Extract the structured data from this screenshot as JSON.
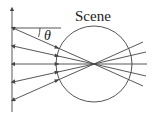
{
  "diagram": {
    "scene_label": "Scene",
    "angle_label": "θ",
    "ray_count": 5,
    "rays_meet_at": "scene center",
    "axis_arrow": "up",
    "line_color": "#444444"
  }
}
